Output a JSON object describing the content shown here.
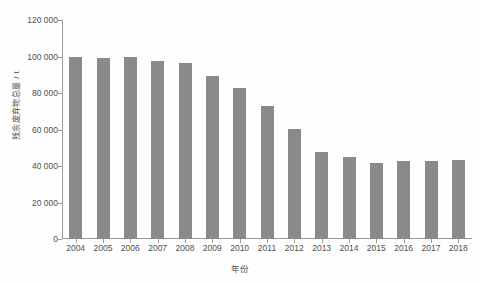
{
  "chart_data": {
    "type": "bar",
    "title": "",
    "subtitle": "",
    "xlabel": "年份",
    "ylabel": "残余废弃物总量 / t",
    "categories": [
      "2004",
      "2005",
      "2006",
      "2007",
      "2008",
      "2009",
      "2010",
      "2011",
      "2012",
      "2013",
      "2014",
      "2015",
      "2016",
      "2017",
      "2018"
    ],
    "values": [
      99500,
      99000,
      100000,
      97500,
      96500,
      89500,
      83000,
      73000,
      60500,
      47500,
      45000,
      41500,
      42500,
      42500,
      43500
    ],
    "series": [
      {
        "name": "残余废弃物总量",
        "values": [
          99500,
          99000,
          100000,
          97500,
          96500,
          89500,
          83000,
          73000,
          60500,
          47500,
          45000,
          41500,
          42500,
          42500,
          43500
        ]
      }
    ],
    "ylim": [
      0,
      120000
    ],
    "yticks": [
      0,
      20000,
      40000,
      60000,
      80000,
      100000,
      120000
    ],
    "ytick_labels": [
      "0",
      "20 000",
      "40 000",
      "60 000",
      "80 000",
      "100 000",
      "120 000"
    ],
    "grid": false,
    "legend": false,
    "legend_position": "none",
    "bar_color": "#8a8a8a",
    "axis_color": "#9a9a9a",
    "text_color": "#4f4f4f",
    "background_color": "#fefefe"
  }
}
